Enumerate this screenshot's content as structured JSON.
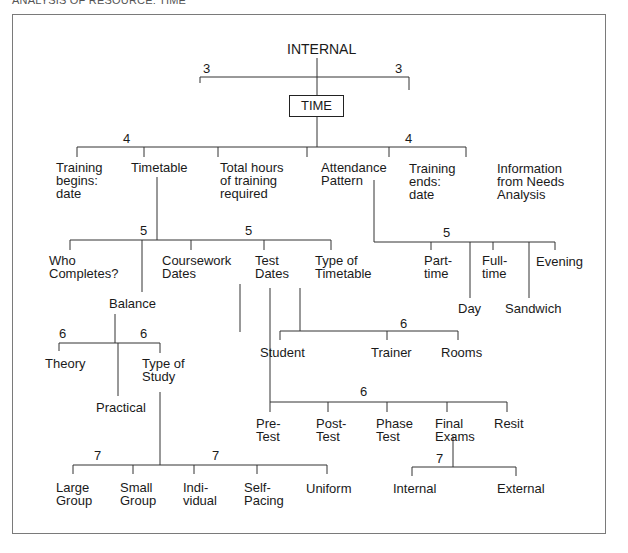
{
  "header": {
    "title": "ANALYSIS OF RESOURCE: TIME"
  },
  "diagram": {
    "root": "INTERNAL",
    "center": "TIME",
    "levels": {
      "l3": [
        "3",
        "3"
      ],
      "l4": [
        "4",
        "4"
      ],
      "l5_timetable": [
        "5",
        "5"
      ],
      "l5_attendance": "5",
      "l6_balance": [
        "6",
        "6"
      ],
      "l6_timetable_type": "6",
      "l6_test_dates": "6",
      "l7_study": [
        "7",
        "7"
      ],
      "l7_exams": "7"
    },
    "time_children": [
      "Training\nbegins:\ndate",
      "Timetable",
      "Total hours\nof training\nrequired",
      "Attendance\nPattern",
      "Training\nends:\ndate",
      "Information\nfrom Needs\nAnalysis"
    ],
    "timetable_children": [
      "Who\nCompletes?",
      "Balance",
      "Coursework\nDates",
      "Test\nDates",
      "Type of\nTimetable"
    ],
    "attendance_children": [
      "Part-\ntime",
      "Day",
      "Full-\ntime",
      "Sandwich",
      "Evening"
    ],
    "balance_children": [
      "Theory",
      "Practical",
      "Type of\nStudy"
    ],
    "timetable_type_children": [
      "Student",
      "Trainer",
      "Rooms"
    ],
    "test_dates_children": [
      "Pre-\nTest",
      "Post-\nTest",
      "Phase\nTest",
      "Final\nExams",
      "Resit"
    ],
    "study_children": [
      "Large\nGroup",
      "Small\nGroup",
      "Indi-\nvidual",
      "Self-\nPacing",
      "Uniform"
    ],
    "exam_children": [
      "Internal",
      "External"
    ]
  }
}
